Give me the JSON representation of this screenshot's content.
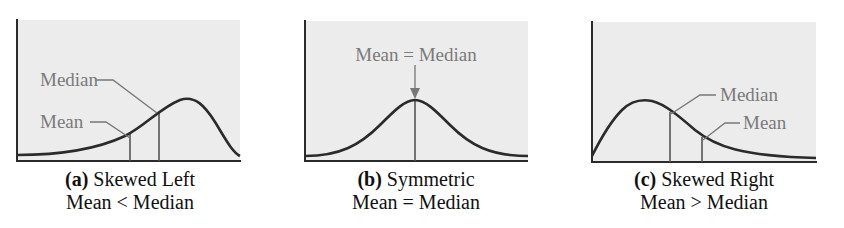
{
  "panels": [
    {
      "id": "a",
      "caption_letter": "(a)",
      "caption_title": "Skewed Left",
      "caption_relation": "Mean < Median",
      "labels": {
        "median": "Median",
        "mean": "Mean"
      }
    },
    {
      "id": "b",
      "caption_letter": "(b)",
      "caption_title": "Symmetric",
      "caption_relation": "Mean = Median",
      "labels": {
        "center": "Mean = Median"
      }
    },
    {
      "id": "c",
      "caption_letter": "(c)",
      "caption_title": "Skewed Right",
      "caption_relation": "Mean > Median",
      "labels": {
        "median": "Median",
        "mean": "Mean"
      }
    }
  ],
  "colors": {
    "panel_bg": "#ececec",
    "curve": "#2b2b2b",
    "axis": "#2b2b2b",
    "marker_line": "#555555",
    "label_text": "#7a7a7a",
    "caption_text": "#111111"
  }
}
